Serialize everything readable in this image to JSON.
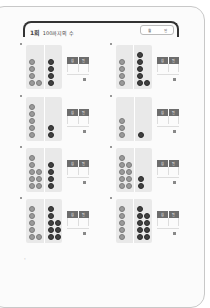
{
  "header": {
    "number": "1회",
    "title": "100까지의 수",
    "date_labels": [
      "월",
      "일"
    ]
  },
  "answer_headers": [
    "십",
    "일"
  ],
  "exercises": [
    {
      "left": [
        1,
        1,
        1,
        2
      ],
      "right": [
        1,
        1,
        1,
        1
      ]
    },
    {
      "left": [
        1,
        1,
        1,
        1
      ],
      "right": [
        1,
        1,
        1,
        1,
        2
      ]
    },
    {
      "left": [
        1,
        1,
        1,
        1,
        1
      ],
      "right": [
        1,
        1
      ]
    },
    {
      "left": [
        1,
        1,
        1
      ],
      "right": [
        1
      ]
    },
    {
      "left": [
        1,
        1,
        2,
        2,
        2
      ],
      "right": [
        1,
        1,
        1,
        1
      ]
    },
    {
      "left": [
        1,
        2,
        2,
        2,
        2
      ],
      "right": [
        1,
        1
      ]
    },
    {
      "left": [
        1,
        1,
        1,
        1,
        2
      ],
      "right": [
        1,
        1,
        2,
        2,
        2
      ]
    },
    {
      "left": [
        1,
        1,
        1,
        1,
        1
      ],
      "right": [
        1,
        2,
        2,
        2,
        2
      ]
    }
  ]
}
